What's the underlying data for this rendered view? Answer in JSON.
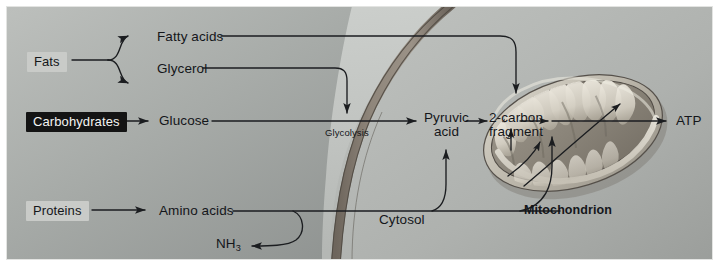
{
  "figure": {
    "caption_label": "Mitochondrion"
  },
  "colors": {
    "plate_border": "#ffffff",
    "cytoplasm_light": "#b9bcb9",
    "cytoplasm_mid": "#9fa3a1",
    "cytoplasm_dark": "#8d918f",
    "extracellular": "#c3c6c3",
    "membrane_band": "#8a8177",
    "membrane_edge": "#4c4741",
    "mitochondrion_outer": "#b6b2a8",
    "mitochondrion_matrix": "#8f8a80",
    "cristae_light": "#e6e2d8",
    "arrow_stroke": "#1b1d20",
    "chip_dark_bg": "#141414",
    "chip_dark_text": "#f4f4f2",
    "chip_light_bg": "#c9cbc8",
    "chip_light_text": "#15171a",
    "text": "#14161a"
  },
  "nodes": {
    "fats": {
      "label": "Fats",
      "style": "chip-light",
      "x": 27,
      "y": 53
    },
    "fatty_acids": {
      "label": "Fatty acids",
      "style": "plain",
      "x": 157,
      "y": 31
    },
    "glycerol": {
      "label": "Glycerol",
      "style": "plain",
      "x": 157,
      "y": 62
    },
    "carbohydrates": {
      "label": "Carbohydrates",
      "style": "chip-dark",
      "x": 26,
      "y": 112
    },
    "glucose": {
      "label": "Glucose",
      "style": "plain",
      "x": 159,
      "y": 114
    },
    "proteins": {
      "label": "Proteins",
      "style": "chip-light",
      "x": 26,
      "y": 202
    },
    "amino_acids": {
      "label": "Amino acids",
      "style": "plain",
      "x": 159,
      "y": 204
    },
    "ammonia": {
      "label_pre": "NH",
      "label_sub": "3",
      "style": "plain",
      "x": 216,
      "y": 237
    },
    "glycolysis": {
      "label": "Glycolysis",
      "style": "small",
      "x": 325,
      "y": 130
    },
    "pyruvic_acid": {
      "label_line1": "Pyruvic",
      "label_line2": "acid",
      "style": "plain",
      "x": 428,
      "y": 112
    },
    "two_carbon_fragment": {
      "label_line1": "2-carbon",
      "label_line2": "fragment",
      "style": "plain",
      "x": 492,
      "y": 112
    },
    "atp": {
      "label": "ATP",
      "style": "plain",
      "x": 676,
      "y": 115
    },
    "cytosol": {
      "label": "Cytosol",
      "style": "plain",
      "x": 379,
      "y": 213
    },
    "mitochondrion": {
      "label": "Mitochondrion",
      "style": "bold",
      "x": 524,
      "y": 204
    }
  },
  "compartments": [
    {
      "name": "extracellular-space",
      "label": ""
    },
    {
      "name": "cytosol",
      "label": "Cytosol"
    },
    {
      "name": "mitochondrion",
      "label": "Mitochondrion"
    }
  ],
  "pathways": [
    {
      "name": "fats-to-fatty-acids",
      "from": "Fats",
      "to": "Fatty acids"
    },
    {
      "name": "fats-to-glycerol",
      "from": "Fats",
      "to": "Glycerol"
    },
    {
      "name": "fatty-acids-to-two-carbon-fragment",
      "from": "Fatty acids",
      "to": "2-carbon fragment"
    },
    {
      "name": "glycerol-to-glycolysis",
      "from": "Glycerol",
      "to": "Glycolysis"
    },
    {
      "name": "carbohydrates-to-glucose",
      "from": "Carbohydrates",
      "to": "Glucose"
    },
    {
      "name": "glucose-to-pyruvic-acid",
      "from": "Glucose",
      "to": "Pyruvic acid"
    },
    {
      "name": "pyruvic-acid-to-two-carbon-fragment",
      "from": "Pyruvic acid",
      "to": "2-carbon fragment"
    },
    {
      "name": "two-carbon-fragment-to-atp",
      "from": "2-carbon fragment",
      "to": "ATP"
    },
    {
      "name": "proteins-to-amino-acids",
      "from": "Proteins",
      "to": "Amino acids"
    },
    {
      "name": "amino-acids-to-ammonia",
      "from": "Amino acids",
      "to": "NH3"
    },
    {
      "name": "amino-acids-to-pyruvic-acid",
      "from": "Amino acids",
      "to": "Pyruvic acid"
    },
    {
      "name": "amino-acids-to-mitochondrion",
      "from": "Amino acids",
      "to": "Mitochondrion"
    }
  ]
}
